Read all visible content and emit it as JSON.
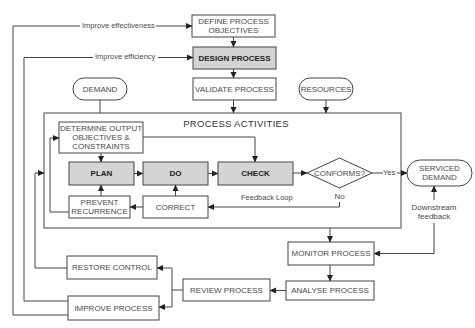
{
  "diagram": {
    "colors": {
      "line": "#444444",
      "highlight_fill": "#d4d4d4",
      "text": "#4a4a4a"
    },
    "frame_title": "PROCESS ACTIVITIES",
    "nodes": {
      "define": {
        "lines": [
          "DEFINE PROCESS",
          "OBJECTIVES"
        ]
      },
      "design": {
        "label": "DESIGN PROCESS",
        "highlighted": true
      },
      "validate": {
        "label": "VALIDATE PROCESS"
      },
      "demand": {
        "label": "DEMAND",
        "shape": "terminal"
      },
      "resources": {
        "label": "RESOURCES",
        "shape": "terminal"
      },
      "determine": {
        "lines": [
          "DETERMINE OUTPUT",
          "OBJECTIVES &",
          "CONSTRAINTS"
        ]
      },
      "plan": {
        "label": "PLAN",
        "highlighted": true
      },
      "do": {
        "label": "DO",
        "highlighted": true
      },
      "check": {
        "label": "CHECK",
        "highlighted": true
      },
      "conforms": {
        "label": "CONFORMS?",
        "shape": "decision"
      },
      "serviced": {
        "lines": [
          "SERVICED",
          "DEMAND"
        ],
        "shape": "terminal"
      },
      "prevent": {
        "lines": [
          "PREVENT",
          "RECURRENCE"
        ]
      },
      "correct": {
        "label": "CORRECT"
      },
      "monitor": {
        "label": "MONITOR PROCESS"
      },
      "analyse": {
        "label": "ANALYSE PROCESS"
      },
      "review": {
        "label": "REVIEW PROCESS"
      },
      "restore": {
        "label": "RESTORE CONTROL"
      },
      "improve": {
        "label": "IMPROVE PROCESS"
      }
    },
    "edge_labels": {
      "improve_effectiveness": "Improve effectiveness",
      "improve_efficiency": "Improve efficiency",
      "yes": "Yes",
      "no": "No",
      "feedback_loop": "Feedback Loop",
      "downstream": [
        "Downstream",
        "feedback"
      ]
    }
  }
}
